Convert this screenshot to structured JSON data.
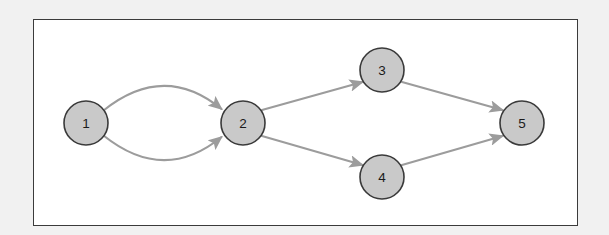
{
  "figure": {
    "kind": "directed-graph-diagram",
    "background_color": "#f1f1f1",
    "frame": {
      "border_color": "#3b3b3b",
      "fill_color": "#ffffff",
      "x": 33,
      "y": 19,
      "width": 545,
      "height": 207
    },
    "style": {
      "node_fill": "#c9c9c9",
      "node_stroke": "#3a3a3a",
      "edge_color": "#9c9c9c",
      "label_color": "#1a1a1a",
      "node_radius": 22
    }
  },
  "graph_data": {
    "type": "diagram",
    "directed": true,
    "nodes": [
      {
        "id": "1",
        "label": "1",
        "cx": 86,
        "cy": 123,
        "r": 22
      },
      {
        "id": "2",
        "label": "2",
        "cx": 243,
        "cy": 123,
        "r": 22
      },
      {
        "id": "3",
        "label": "3",
        "cx": 382,
        "cy": 70,
        "r": 22
      },
      {
        "id": "4",
        "label": "4",
        "cx": 382,
        "cy": 177,
        "r": 22
      },
      {
        "id": "5",
        "label": "5",
        "cx": 522,
        "cy": 123,
        "r": 22
      }
    ],
    "edges": [
      {
        "id": "e1",
        "from": "1",
        "to": "2",
        "shape": "curve-up",
        "arrow": true
      },
      {
        "id": "e2",
        "from": "1",
        "to": "2",
        "shape": "curve-down",
        "arrow": true
      },
      {
        "id": "e3",
        "from": "2",
        "to": "3",
        "shape": "straight",
        "arrow": true
      },
      {
        "id": "e4",
        "from": "2",
        "to": "4",
        "shape": "straight",
        "arrow": true
      },
      {
        "id": "e5",
        "from": "3",
        "to": "5",
        "shape": "straight",
        "arrow": true
      },
      {
        "id": "e6",
        "from": "4",
        "to": "5",
        "shape": "straight",
        "arrow": true
      }
    ],
    "edge_paths": {
      "e1": "M 103.5,110.5 Q 164,62 221.5,109",
      "e2": "M 103.5,135.5 Q 164,184 221.5,137",
      "e3": "M 262,110 L 362.5,82",
      "e4": "M 262,136 L 362.5,165",
      "e5": "M 402,82 L 502.5,110",
      "e6": "M 402,165 L 502.5,136"
    }
  }
}
